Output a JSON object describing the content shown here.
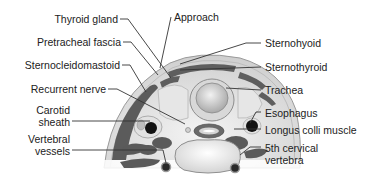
{
  "figure": {
    "labels_left": [
      {
        "id": "thyroid",
        "text": "Thyroid gland"
      },
      {
        "id": "pretracheal",
        "text": "Pretracheal fascia"
      },
      {
        "id": "scm",
        "text": "Sternocleidomastoid"
      },
      {
        "id": "recurrent",
        "text": "Recurrent nerve"
      },
      {
        "id": "carotid",
        "line1": "Carotid",
        "line2": "sheath"
      },
      {
        "id": "vertebral",
        "line1": "Vertebral",
        "line2": "vessels"
      }
    ],
    "labels_top": [
      {
        "id": "approach",
        "text": "Approach"
      }
    ],
    "labels_right": [
      {
        "id": "sternohyoid",
        "text": "Sternohyoid"
      },
      {
        "id": "sternothyroid",
        "text": "Sternothyroid"
      },
      {
        "id": "trachea",
        "text": "Trachea"
      },
      {
        "id": "esophagus",
        "text": "Esophagus"
      },
      {
        "id": "longus",
        "text": "Longus colli muscle"
      },
      {
        "id": "vertebra",
        "line1": "5th cervical",
        "line2": "vertebra"
      }
    ],
    "colors": {
      "muscle": "#5a5a5a",
      "skin": "#d8d8d8",
      "tissue": "#eeeeee",
      "bone": "#f7f7f7",
      "vessel": "#111111",
      "leader": "#333333"
    }
  }
}
